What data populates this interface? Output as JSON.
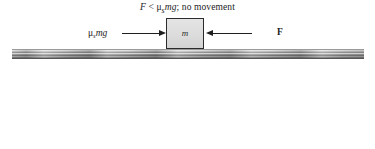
{
  "figure": {
    "caption": {
      "force_symbol": "F",
      "relation": "<",
      "friction_expr": "μ",
      "friction_sub": "s",
      "friction_rest": "mg",
      "separator": ";",
      "result": "no movement",
      "full_text": "F < μsmg; no movement"
    },
    "panels": [
      {
        "id": "static",
        "name": "static-friction-panel",
        "block_label": "m",
        "friction_label": {
          "mu": "μ",
          "sub": "s",
          "rest": "mg",
          "full_text": "μsmg"
        },
        "applied_force_label": {
          "full_text": "F"
        },
        "surface_name": "ground-surface"
      },
      {
        "id": "kinetic",
        "name": "kinetic-friction-panel",
        "block_label": "m",
        "friction_label": {
          "mu": "μ",
          "sub": "k",
          "rest": "mg",
          "full_text": "μkmg"
        },
        "applied_force_label": {
          "sym": "F",
          "equals": "=",
          "mu": "μ",
          "sub": "s",
          "rest": "mg",
          "full_text": "F = μsmg"
        },
        "acceleration_label": "a",
        "surface_name": "ground-surface"
      }
    ],
    "colors": {
      "background": "#ffffff",
      "block_fill": "#dcdcdc",
      "block_border": "#2b2b2b",
      "arrow": "#1e1e1e",
      "text": "#1c1c1c",
      "surface_light": "#cfcfcf",
      "surface_dark": "#5e5e5e"
    }
  }
}
